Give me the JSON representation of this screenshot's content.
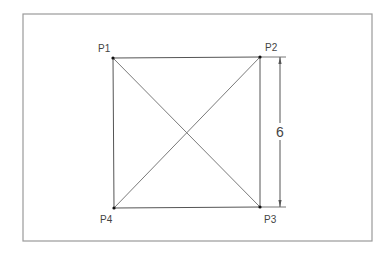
{
  "diagram": {
    "type": "geometry-square-with-diagonals",
    "points": [
      {
        "id": "P1",
        "label": "P1",
        "x": 113,
        "y": 58,
        "label_x": 98,
        "label_y": 52
      },
      {
        "id": "P2",
        "label": "P2",
        "x": 260,
        "y": 57,
        "label_x": 265,
        "label_y": 51
      },
      {
        "id": "P3",
        "label": "P3",
        "x": 260,
        "y": 207,
        "label_x": 264,
        "label_y": 223
      },
      {
        "id": "P4",
        "label": "P4",
        "x": 114,
        "y": 208,
        "label_x": 100,
        "label_y": 223
      }
    ],
    "edges": [
      [
        "P1",
        "P2"
      ],
      [
        "P2",
        "P3"
      ],
      [
        "P3",
        "P4"
      ],
      [
        "P4",
        "P1"
      ]
    ],
    "diagonals": [
      [
        "P1",
        "P3"
      ],
      [
        "P2",
        "P4"
      ]
    ],
    "dimension": {
      "label": "6",
      "measures": "P2-P3",
      "line_x": 280,
      "y_start": 57,
      "y_end": 207,
      "label_y": 137
    },
    "frame": {
      "x": 23,
      "y": 14,
      "width": 349,
      "height": 227
    },
    "colors": {
      "frame": "#9a9a9a",
      "edge": "#555555",
      "diagonal": "#7a7a7a",
      "point": "#111111",
      "text": "#444444"
    }
  }
}
